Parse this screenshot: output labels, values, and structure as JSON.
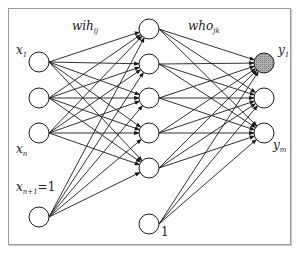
{
  "diagram": {
    "type": "neural-network",
    "weights": {
      "input_hidden": {
        "base": "wih",
        "sub": "ij"
      },
      "hidden_output": {
        "base": "who",
        "sub": "jk"
      }
    },
    "input_layer": {
      "nodes": [
        {
          "label": "x",
          "sub": "1",
          "y": 62
        },
        {
          "label": "",
          "sub": "",
          "y": 98
        },
        {
          "label": "x",
          "sub": "n",
          "y": 133
        },
        {
          "label": "x",
          "sub": "n+1",
          "suffix": "=1",
          "y": 217
        }
      ]
    },
    "hidden_layer": {
      "nodes": [
        {
          "y": 29
        },
        {
          "y": 64
        },
        {
          "y": 98
        },
        {
          "y": 133
        },
        {
          "y": 168
        },
        {
          "label": "1",
          "y": 224,
          "bias": true
        }
      ]
    },
    "output_layer": {
      "nodes": [
        {
          "label": "y",
          "sub": "1",
          "y": 63,
          "highlighted": true
        },
        {
          "label": "",
          "sub": "",
          "y": 98
        },
        {
          "label": "y",
          "sub": "m",
          "y": 133
        }
      ]
    },
    "colors": {
      "line": "#1a1a1a",
      "highlight_fill": "#9e9e9e",
      "frame": "#9a9a9a"
    }
  }
}
